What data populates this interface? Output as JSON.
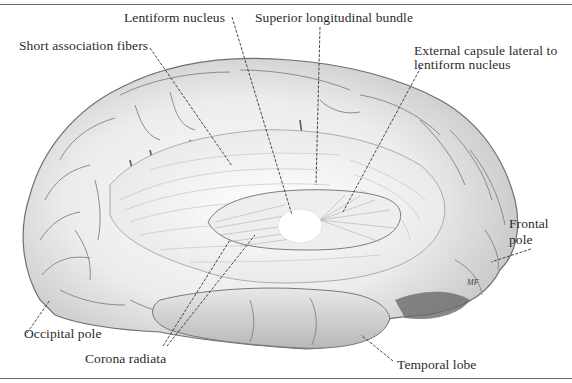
{
  "figure": {
    "labels": {
      "lentiform_nucleus": "Lentiform nucleus",
      "superior_longitudinal_bundle": "Superior longitudinal bundle",
      "short_association_fibers": "Short association fibers",
      "external_capsule_line1": "External capsule lateral to",
      "external_capsule_line2": "lentiform nucleus",
      "frontal_pole_line1": "Frontal",
      "frontal_pole_line2": "pole",
      "occipital_pole": "Occipital pole",
      "corona_radiata": "Corona radiata",
      "temporal_lobe": "Temporal lobe"
    },
    "signature": "MF",
    "colors": {
      "ink": "#2b2b2b",
      "rule": "#6a6a6a",
      "brain_light": "#f1f1f1",
      "brain_mid": "#cfcfcf",
      "brain_dark": "#8a8a8a",
      "shadow": "#4a4a4a"
    }
  }
}
